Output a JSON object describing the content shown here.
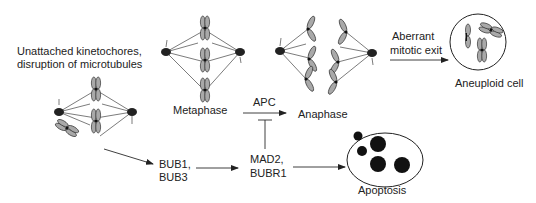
{
  "diagram": {
    "labels": {
      "trigger_line1": "Unattached kinetochores,",
      "trigger_line2": "disruption of microtubules",
      "metaphase": "Metaphase",
      "apc": "APC",
      "anaphase": "Anaphase",
      "aberrant_line1": "Aberrant",
      "aberrant_line2": "mitotic exit",
      "aneuploid": "Aneuploid cell",
      "bub_line1": "BUB1,",
      "bub_line2": "BUB3",
      "mad_line1": "MAD2,",
      "mad_line2": "BUBR1",
      "apoptosis": "Apoptosis"
    },
    "nodes": [
      {
        "id": "unattached",
        "label": "Unattached kinetochores, disruption of microtubules"
      },
      {
        "id": "metaphase",
        "label": "Metaphase"
      },
      {
        "id": "anaphase",
        "label": "Anaphase"
      },
      {
        "id": "aneuploid",
        "label": "Aneuploid cell"
      },
      {
        "id": "bub",
        "label": "BUB1, BUB3"
      },
      {
        "id": "mad",
        "label": "MAD2, BUBR1"
      },
      {
        "id": "apoptosis",
        "label": "Apoptosis"
      }
    ],
    "edges": [
      {
        "from": "metaphase",
        "to": "anaphase",
        "label": "APC",
        "type": "activation"
      },
      {
        "from": "anaphase",
        "to": "aneuploid",
        "label": "Aberrant mitotic exit",
        "type": "activation"
      },
      {
        "from": "unattached",
        "to": "bub",
        "type": "activation"
      },
      {
        "from": "bub",
        "to": "mad",
        "type": "activation"
      },
      {
        "from": "mad",
        "to": "apc_edge",
        "type": "inhibition"
      },
      {
        "from": "mad",
        "to": "apoptosis",
        "type": "activation"
      }
    ]
  }
}
